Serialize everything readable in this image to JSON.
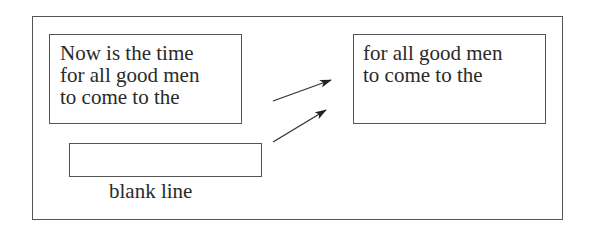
{
  "diagram": {
    "source_buffer": {
      "lines": [
        "Now is the time",
        "for all good men",
        "to come to the"
      ]
    },
    "blank_line_box": {
      "label": "blank line"
    },
    "result_buffer": {
      "lines": [
        "for all good men",
        "to come to the"
      ]
    },
    "arrows": [
      {
        "from": [
          273,
          101
        ],
        "to": [
          331,
          80
        ]
      },
      {
        "from": [
          273,
          142
        ],
        "to": [
          326,
          110
        ]
      }
    ]
  }
}
